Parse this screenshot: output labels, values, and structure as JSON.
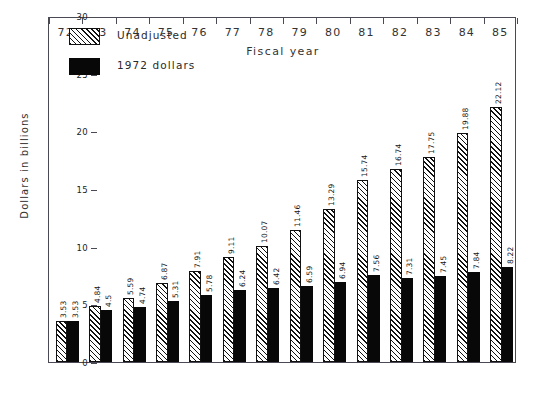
{
  "chart_data": {
    "type": "bar",
    "title": "",
    "xlabel": "Fiscal year",
    "ylabel": "Dollars in billions",
    "categories": [
      "72",
      "73",
      "74",
      "75",
      "76",
      "77",
      "78",
      "79",
      "80",
      "81",
      "82",
      "83",
      "84",
      "85"
    ],
    "series": [
      {
        "name": "Unadjusted",
        "fill": "hatched-diagonal",
        "values": [
          3.53,
          4.84,
          5.59,
          6.87,
          7.91,
          9.11,
          10.07,
          11.46,
          13.29,
          15.74,
          16.74,
          17.75,
          19.88,
          22.12
        ],
        "labels": [
          "3.53",
          "4.84",
          "5.59",
          "6.87",
          "7.91",
          "9.11",
          "10.07",
          "11.46",
          "13.29",
          "15.74",
          "16.74",
          "17.75",
          "19.88",
          "22.12"
        ]
      },
      {
        "name": "1972 dollars",
        "fill": "solid-black",
        "values": [
          3.53,
          4.5,
          4.74,
          5.31,
          5.78,
          6.24,
          6.42,
          6.59,
          6.94,
          7.56,
          7.31,
          7.45,
          7.84,
          8.22
        ],
        "labels": [
          "3.53",
          "4.5",
          "4.74",
          "5.31",
          "5.78",
          "6.24",
          "6.42",
          "6.59",
          "6.94",
          "7.56",
          "7.31",
          "7.45",
          "7.84",
          "8.22"
        ]
      }
    ],
    "ylim": [
      0,
      30
    ],
    "yticks": [
      0,
      5,
      10,
      15,
      20,
      25,
      30
    ],
    "ytick_labels": [
      "0",
      "5",
      "10",
      "15",
      "20",
      "25",
      "30"
    ],
    "grid": false,
    "legend_position": "top-left",
    "colors": {
      "axis": "#4a4a55",
      "text": "#2a2a2a",
      "unadjusted_fill": "#ffffff",
      "unadjusted_hatch": "#111111",
      "adjusted_fill": "#080808",
      "background": "#ffffff"
    }
  },
  "legend": {
    "entries": [
      {
        "label": "Unadjusted",
        "swatch": "hatched-diagonal"
      },
      {
        "label": "1972 dollars",
        "swatch": "solid-black"
      }
    ]
  }
}
